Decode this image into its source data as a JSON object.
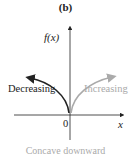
{
  "panel_label": "(b)",
  "axes": {
    "y_label": "f(x)",
    "x_label": "x",
    "origin_label": "0"
  },
  "curves": {
    "left": {
      "label": "Decreasing",
      "color": "#222222"
    },
    "right": {
      "label": "Increasing",
      "color": "#aaaaaa"
    }
  },
  "caption": "Concave downward"
}
